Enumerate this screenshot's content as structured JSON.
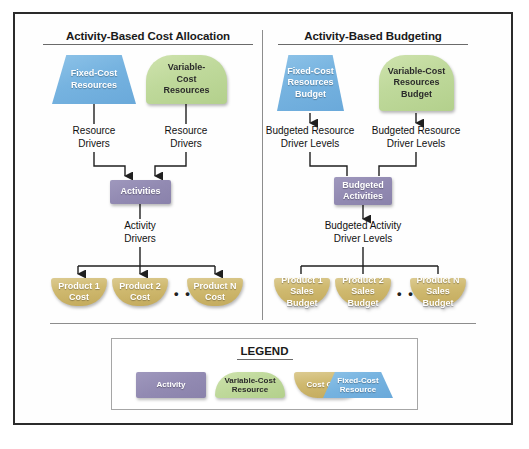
{
  "diagram": {
    "panels": [
      {
        "id": "cost-allocation",
        "title": "Activity-Based Cost Allocation",
        "resources": [
          {
            "id": "fixed-cost-resources",
            "label": "Fixed-Cost\nResources",
            "shape": "trapezoid",
            "color": "#76b3e0"
          },
          {
            "id": "variable-cost-resources",
            "label": "Variable-\nCost\nResources",
            "shape": "arch",
            "color": "#bfd99b"
          }
        ],
        "resource_driver_labels": [
          "Resource\nDrivers",
          "Resource\nDrivers"
        ],
        "activity": {
          "id": "activities",
          "label": "Activities",
          "shape": "rectangle",
          "color": "#928ab2"
        },
        "activity_driver_label": "Activity\nDrivers",
        "cost_objects": [
          {
            "id": "product-1-cost",
            "label": "Product 1\nCost"
          },
          {
            "id": "product-2-cost",
            "label": "Product 2\nCost"
          },
          {
            "id": "product-n-cost",
            "label": "Product N\nCost"
          }
        ],
        "ellipsis": "• • •",
        "flow_direction": "downward"
      },
      {
        "id": "budgeting",
        "title": "Activity-Based Budgeting",
        "resources": [
          {
            "id": "fixed-cost-resources-budget",
            "label": "Fixed-Cost\nResources\nBudget",
            "shape": "trapezoid",
            "color": "#76b3e0"
          },
          {
            "id": "variable-cost-resources-budget",
            "label": "Variable-Cost\nResources\nBudget",
            "shape": "arch",
            "color": "#bfd99b"
          }
        ],
        "resource_driver_labels": [
          "Budgeted Resource\nDriver Levels",
          "Budgeted Resource\nDriver Levels"
        ],
        "activity": {
          "id": "budgeted-activities",
          "label": "Budgeted\nActivities",
          "shape": "rectangle",
          "color": "#928ab2"
        },
        "activity_driver_label": "Budgeted Activity\nDriver Levels",
        "cost_objects": [
          {
            "id": "product-1-sales-budget",
            "label": "Product 1\nSales Budget"
          },
          {
            "id": "product-2-sales-budget",
            "label": "Product 2\nSales Budget"
          },
          {
            "id": "product-n-sales-budget",
            "label": "Product N\nSales Budget"
          }
        ],
        "ellipsis": "• • •",
        "flow_direction": "upward"
      }
    ],
    "legend": {
      "title": "LEGEND",
      "items": [
        {
          "id": "legend-activity",
          "label": "Activity",
          "shape": "rectangle",
          "color": "#928ab2"
        },
        {
          "id": "legend-variable-cost-resource",
          "label": "Variable-Cost\nResource",
          "shape": "arch",
          "color": "#bfd99b"
        },
        {
          "id": "legend-cost-object",
          "label": "Cost Object",
          "shape": "cost-object",
          "color": "#cfb96f"
        },
        {
          "id": "legend-fixed-cost-resource",
          "label": "Fixed-Cost\nResource",
          "shape": "trapezoid",
          "color": "#76b3e0"
        }
      ]
    }
  }
}
